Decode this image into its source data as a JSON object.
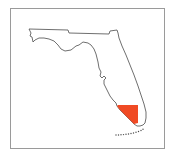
{
  "map": {
    "region": "Florida",
    "highlighted_area": {
      "color": "#F04A24"
    },
    "outline_color": "#4a4a4a",
    "frame_color": "#9a9a9a"
  }
}
